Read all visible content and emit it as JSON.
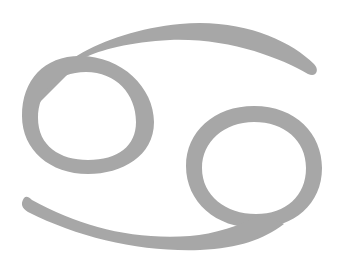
{
  "symbol": {
    "name": "Cancer zodiac symbol",
    "glyph": "♋",
    "color": "#a7a7a7",
    "background": "#ffffff"
  }
}
